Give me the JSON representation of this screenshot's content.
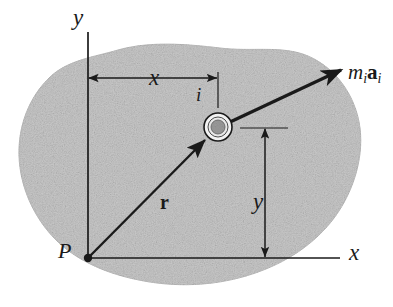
{
  "figure": {
    "background_color": "#ffffff",
    "body_fill_color": "#c9c9c9",
    "body_edge_color": "#bdbdbd",
    "line_color": "#1a1a1a",
    "particle_inner_color": "#9a9a9a"
  },
  "labels": {
    "axis_y": "y",
    "axis_x": "x",
    "origin_point": "P",
    "dimension_x": "x",
    "dimension_y": "y",
    "particle": "i",
    "position_vector": "r",
    "force_vector_m": "m",
    "force_vector_m_sub": "i",
    "force_vector_a": "a",
    "force_vector_a_sub": "i"
  },
  "geometry": {
    "origin": {
      "x": 88,
      "y": 258
    },
    "particle_center": {
      "x": 218,
      "y": 127
    },
    "y_axis_top": {
      "x": 88,
      "y": 32
    },
    "x_axis_right": {
      "x": 340,
      "y": 258
    },
    "force_arrow_tip": {
      "x": 344,
      "y": 68
    },
    "dimension_x_line_y": 78,
    "dimension_y_line_x": 265,
    "particle_outer_radius": 14,
    "particle_inner_radius": 7
  }
}
